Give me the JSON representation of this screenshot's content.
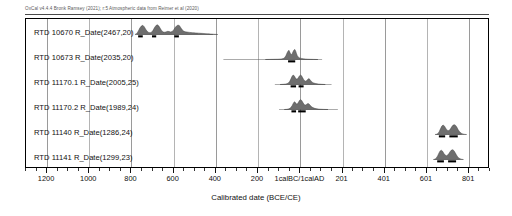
{
  "header": {
    "credit": "OxCal v4.4.4 Bronk Ramsey (2021); r:5 Atmospheric data from Reimer et al (2020)"
  },
  "axis": {
    "title": "Calibrated date (BCE/CE)",
    "tick_labels": [
      "1200",
      "1000",
      "800",
      "600",
      "400",
      "200",
      "1calBC/1calAD",
      "201",
      "401",
      "601",
      "801"
    ],
    "domain_min": -1300,
    "domain_max": 900
  },
  "rows": [
    {
      "label": "RTD 10670 R_Date(2467,20)"
    },
    {
      "label": "RTD 10673 R_Date(2035,20)"
    },
    {
      "label": "RTD 11170.1 R_Date(2005,25)"
    },
    {
      "label": "RTD 11170.2 R_Date(1989,24)"
    },
    {
      "label": "RTD 11140 R_Date(1286,24)"
    },
    {
      "label": "RTD 11141 R_Date(1299,23)"
    }
  ],
  "chart_data": {
    "type": "area",
    "xlabel": "Calibrated date (BCE/CE)",
    "ylabel": "",
    "xlim": [
      -1300,
      900
    ],
    "grid": true,
    "legend": "none",
    "x_tick_values": [
      -1200,
      -1000,
      -800,
      -600,
      -400,
      -200,
      1,
      201,
      401,
      601,
      801
    ],
    "x_tick_labels": [
      "1200",
      "1000",
      "800",
      "600",
      "400",
      "200",
      "1calBC/1calAD",
      "201",
      "401",
      "601",
      "801"
    ],
    "colors": {
      "pdf_fill": "#6e6e6e",
      "pdf_line": "#3c3c3c",
      "range_bar": "#000000",
      "grid": "#9a9a9a",
      "frame": "#000000"
    },
    "series": [
      {
        "name": "RTD 10670 R_Date(2467,20)",
        "lab_code": "RTD 10670",
        "bp": 2467,
        "error": 20,
        "pdf": [
          [
            -780,
            0.02
          ],
          [
            -772,
            0.1
          ],
          [
            -765,
            0.34
          ],
          [
            -758,
            0.62
          ],
          [
            -751,
            0.8
          ],
          [
            -744,
            0.88
          ],
          [
            -737,
            0.74
          ],
          [
            -730,
            0.5
          ],
          [
            -723,
            0.3
          ],
          [
            -716,
            0.2
          ],
          [
            -709,
            0.16
          ],
          [
            -702,
            0.22
          ],
          [
            -695,
            0.4
          ],
          [
            -688,
            0.66
          ],
          [
            -681,
            0.86
          ],
          [
            -674,
            0.92
          ],
          [
            -667,
            0.8
          ],
          [
            -660,
            0.56
          ],
          [
            -653,
            0.34
          ],
          [
            -646,
            0.24
          ],
          [
            -639,
            0.22
          ],
          [
            -632,
            0.26
          ],
          [
            -625,
            0.3
          ],
          [
            -618,
            0.28
          ],
          [
            -611,
            0.24
          ],
          [
            -604,
            0.28
          ],
          [
            -597,
            0.44
          ],
          [
            -590,
            0.66
          ],
          [
            -583,
            0.82
          ],
          [
            -576,
            0.9
          ],
          [
            -569,
            0.84
          ],
          [
            -562,
            0.62
          ],
          [
            -555,
            0.42
          ],
          [
            -548,
            0.3
          ],
          [
            -541,
            0.26
          ],
          [
            -534,
            0.24
          ],
          [
            -527,
            0.22
          ],
          [
            -520,
            0.2
          ],
          [
            -513,
            0.18
          ],
          [
            -506,
            0.17
          ],
          [
            -499,
            0.16
          ],
          [
            -492,
            0.15
          ],
          [
            -485,
            0.14
          ],
          [
            -478,
            0.13
          ],
          [
            -471,
            0.12
          ],
          [
            -464,
            0.11
          ],
          [
            -457,
            0.1
          ],
          [
            -450,
            0.09
          ],
          [
            -443,
            0.08
          ],
          [
            -436,
            0.07
          ],
          [
            -429,
            0.06
          ],
          [
            -422,
            0.05
          ],
          [
            -415,
            0.04
          ],
          [
            -408,
            0.03
          ],
          [
            -401,
            0.02
          ],
          [
            -394,
            0.01
          ],
          [
            -387,
            0.0
          ]
        ],
        "ranges_68": [
          [
            -766,
            -744
          ],
          [
            -700,
            -680
          ],
          [
            -594,
            -572
          ]
        ],
        "ranges_95": [
          [
            -770,
            -410
          ]
        ]
      },
      {
        "name": "RTD 10673 R_Date(2035,20)",
        "lab_code": "RTD 10673",
        "bp": 2035,
        "error": 20,
        "pdf": [
          [
            -160,
            0.0
          ],
          [
            -140,
            0.01
          ],
          [
            -120,
            0.02
          ],
          [
            -100,
            0.03
          ],
          [
            -85,
            0.05
          ],
          [
            -75,
            0.09
          ],
          [
            -68,
            0.18
          ],
          [
            -62,
            0.38
          ],
          [
            -57,
            0.62
          ],
          [
            -52,
            0.8
          ],
          [
            -48,
            0.88
          ],
          [
            -44,
            0.72
          ],
          [
            -40,
            0.52
          ],
          [
            -36,
            0.48
          ],
          [
            -32,
            0.58
          ],
          [
            -28,
            0.76
          ],
          [
            -24,
            0.9
          ],
          [
            -20,
            0.96
          ],
          [
            -16,
            0.82
          ],
          [
            -12,
            0.58
          ],
          [
            -8,
            0.36
          ],
          [
            -4,
            0.24
          ],
          [
            1,
            0.17
          ],
          [
            6,
            0.13
          ],
          [
            12,
            0.1
          ],
          [
            20,
            0.07
          ],
          [
            30,
            0.05
          ],
          [
            42,
            0.03
          ],
          [
            55,
            0.02
          ],
          [
            70,
            0.01
          ],
          [
            90,
            0.0
          ]
        ],
        "ranges_68": [
          [
            -52,
            -18
          ]
        ],
        "ranges_95": [
          [
            -360,
            110
          ]
        ]
      },
      {
        "name": "RTD 11170.1 R_Date(2005,25)",
        "lab_code": "RTD 11170.1",
        "bp": 2005,
        "error": 25,
        "pdf": [
          [
            -90,
            0.0
          ],
          [
            -75,
            0.02
          ],
          [
            -62,
            0.05
          ],
          [
            -52,
            0.12
          ],
          [
            -44,
            0.3
          ],
          [
            -38,
            0.56
          ],
          [
            -33,
            0.78
          ],
          [
            -28,
            0.9
          ],
          [
            -23,
            0.84
          ],
          [
            -18,
            0.66
          ],
          [
            -13,
            0.52
          ],
          [
            -8,
            0.52
          ],
          [
            -3,
            0.66
          ],
          [
            2,
            0.82
          ],
          [
            7,
            0.9
          ],
          [
            12,
            0.84
          ],
          [
            17,
            0.66
          ],
          [
            22,
            0.48
          ],
          [
            27,
            0.36
          ],
          [
            32,
            0.32
          ],
          [
            37,
            0.38
          ],
          [
            42,
            0.5
          ],
          [
            47,
            0.56
          ],
          [
            52,
            0.48
          ],
          [
            57,
            0.34
          ],
          [
            63,
            0.22
          ],
          [
            70,
            0.14
          ],
          [
            80,
            0.09
          ],
          [
            92,
            0.05
          ],
          [
            108,
            0.02
          ],
          [
            125,
            0.0
          ]
        ],
        "ranges_68": [
          [
            -40,
            -14
          ],
          [
            -2,
            22
          ]
        ],
        "ranges_95": [
          [
            -115,
            155
          ]
        ]
      },
      {
        "name": "RTD 11170.2 R_Date(1989,24)",
        "lab_code": "RTD 11170.2",
        "bp": 1989,
        "error": 24,
        "pdf": [
          [
            -70,
            0.0
          ],
          [
            -58,
            0.02
          ],
          [
            -48,
            0.06
          ],
          [
            -40,
            0.16
          ],
          [
            -33,
            0.36
          ],
          [
            -27,
            0.6
          ],
          [
            -22,
            0.74
          ],
          [
            -17,
            0.66
          ],
          [
            -12,
            0.52
          ],
          [
            -7,
            0.54
          ],
          [
            -2,
            0.72
          ],
          [
            3,
            0.88
          ],
          [
            8,
            0.94
          ],
          [
            13,
            0.86
          ],
          [
            18,
            0.68
          ],
          [
            23,
            0.52
          ],
          [
            28,
            0.44
          ],
          [
            33,
            0.44
          ],
          [
            38,
            0.52
          ],
          [
            43,
            0.58
          ],
          [
            48,
            0.52
          ],
          [
            53,
            0.4
          ],
          [
            59,
            0.28
          ],
          [
            66,
            0.18
          ],
          [
            75,
            0.11
          ],
          [
            86,
            0.06
          ],
          [
            100,
            0.03
          ],
          [
            118,
            0.01
          ],
          [
            138,
            0.0
          ]
        ],
        "ranges_68": [
          [
            -36,
            -14
          ],
          [
            -4,
            32
          ]
        ],
        "ranges_95": [
          [
            -95,
            185
          ]
        ]
      },
      {
        "name": "RTD 11140 R_Date(1286,24)",
        "lab_code": "RTD 11140",
        "bp": 1286,
        "error": 24,
        "pdf": [
          [
            648,
            0.0
          ],
          [
            656,
            0.03
          ],
          [
            662,
            0.1
          ],
          [
            668,
            0.28
          ],
          [
            674,
            0.56
          ],
          [
            680,
            0.8
          ],
          [
            686,
            0.9
          ],
          [
            692,
            0.82
          ],
          [
            698,
            0.62
          ],
          [
            704,
            0.44
          ],
          [
            710,
            0.36
          ],
          [
            716,
            0.4
          ],
          [
            722,
            0.56
          ],
          [
            728,
            0.76
          ],
          [
            734,
            0.9
          ],
          [
            740,
            0.94
          ],
          [
            746,
            0.86
          ],
          [
            752,
            0.68
          ],
          [
            758,
            0.46
          ],
          [
            764,
            0.28
          ],
          [
            770,
            0.16
          ],
          [
            776,
            0.08
          ],
          [
            783,
            0.04
          ],
          [
            790,
            0.01
          ],
          [
            798,
            0.0
          ]
        ],
        "ranges_68": [
          [
            666,
            696
          ],
          [
            716,
            756
          ]
        ],
        "ranges_95": [
          [
            655,
            775
          ]
        ]
      },
      {
        "name": "RTD 11141 R_Date(1299,23)",
        "lab_code": "RTD 11141",
        "bp": 1299,
        "error": 23,
        "pdf": [
          [
            640,
            0.0
          ],
          [
            648,
            0.04
          ],
          [
            654,
            0.14
          ],
          [
            660,
            0.34
          ],
          [
            666,
            0.6
          ],
          [
            672,
            0.82
          ],
          [
            678,
            0.88
          ],
          [
            684,
            0.78
          ],
          [
            690,
            0.58
          ],
          [
            696,
            0.42
          ],
          [
            702,
            0.36
          ],
          [
            708,
            0.42
          ],
          [
            714,
            0.58
          ],
          [
            720,
            0.76
          ],
          [
            726,
            0.9
          ],
          [
            732,
            0.94
          ],
          [
            738,
            0.84
          ],
          [
            744,
            0.64
          ],
          [
            750,
            0.42
          ],
          [
            756,
            0.25
          ],
          [
            762,
            0.13
          ],
          [
            768,
            0.06
          ],
          [
            775,
            0.02
          ],
          [
            783,
            0.0
          ]
        ],
        "ranges_68": [
          [
            658,
            690
          ],
          [
            710,
            748
          ]
        ],
        "ranges_95": [
          [
            646,
            766
          ]
        ]
      }
    ]
  }
}
